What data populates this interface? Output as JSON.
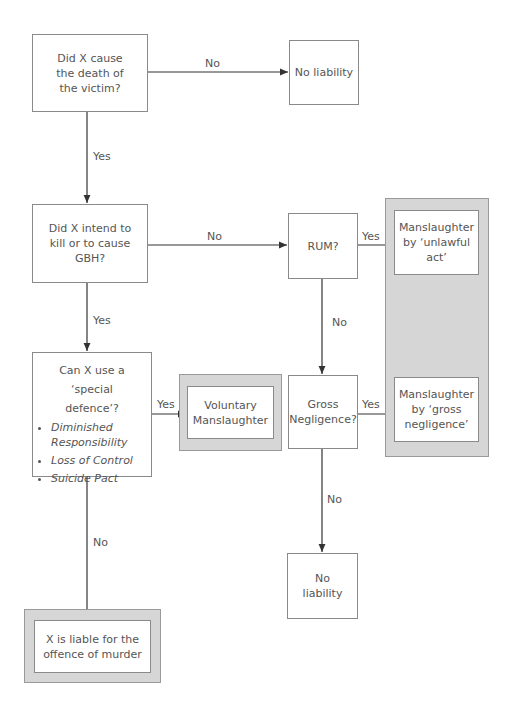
{
  "nodes": {
    "q_cause": "Did X cause the death of the victim?",
    "no_liability_1": "No liability",
    "q_intend": "Did X intend to kill or to cause GBH?",
    "q_rum": "RUM?",
    "manslaughter_unlawful": "Manslaughter by ‘unlawful act’",
    "q_defence": "Can X use a ‘special defence’?",
    "defences": [
      "Diminished Responsibility",
      "Loss of Control",
      "Suicide Pact"
    ],
    "voluntary": "Voluntary Manslaughter",
    "q_gross": "Gross Negligence?",
    "manslaughter_gross": "Manslaughter by ‘gross negligence’",
    "no_liability_2": "No liability",
    "murder": "X is liable for the offence of murder"
  },
  "edges": {
    "cause_no": "No",
    "cause_yes": "Yes",
    "intend_no": "No",
    "intend_yes": "Yes",
    "rum_yes": "Yes",
    "rum_no": "No",
    "defence_yes": "Yes",
    "defence_no": "No",
    "gross_yes": "Yes",
    "gross_no": "No"
  },
  "colors": {
    "panel_fill": "#d6d6d6",
    "border": "#8a8a8a",
    "line": "#333333"
  }
}
